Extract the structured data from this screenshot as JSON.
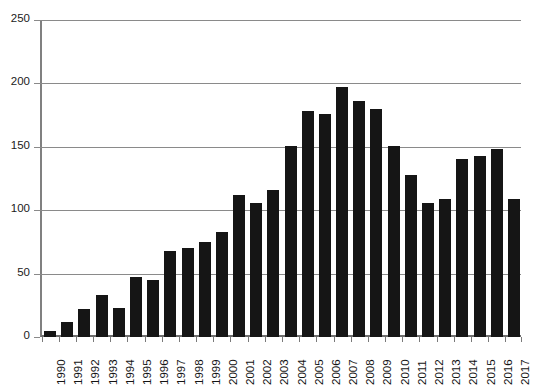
{
  "chart_data": {
    "type": "bar",
    "title": "",
    "subtitle": "",
    "xlabel": "",
    "ylabel": "",
    "categories": [
      "1990",
      "1991",
      "1992",
      "1993",
      "1994",
      "1995",
      "1996",
      "1997",
      "1998",
      "1999",
      "2000",
      "2001",
      "2002",
      "2003",
      "2004",
      "2005",
      "2006",
      "2007",
      "2008",
      "2009",
      "2010",
      "2011",
      "2012",
      "2013",
      "2014",
      "2015",
      "2016",
      "2017"
    ],
    "values": [
      5,
      12,
      22,
      33,
      23,
      47,
      45,
      68,
      70,
      75,
      83,
      112,
      106,
      116,
      151,
      178,
      176,
      197,
      186,
      180,
      151,
      128,
      106,
      109,
      140,
      143,
      148,
      109
    ],
    "ylim": [
      0,
      250
    ],
    "yticks": [
      0,
      50,
      100,
      150,
      200,
      250
    ],
    "ytick_labels": [
      "0",
      "50",
      "100",
      "150",
      "200",
      "250"
    ],
    "grid": true,
    "legend": false,
    "legend_position": "none",
    "bar_color": "#151515",
    "axis_color": "#8a8a8a",
    "background": "#ffffff"
  }
}
